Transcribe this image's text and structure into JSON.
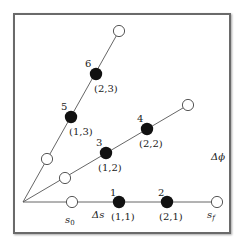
{
  "diagram": {
    "type": "ray-lattice",
    "colors": {
      "line": "#555555",
      "filled_node": "#111111",
      "open_node_fill": "#ffffff",
      "open_node_stroke": "#444444",
      "text": "#222222",
      "frame": "#6a6a6a"
    },
    "rays": [
      {
        "id": "ray-1",
        "nodes": [
          {
            "kind": "open",
            "label": "",
            "pair": ""
          },
          {
            "kind": "filled",
            "label": "1",
            "pair": "(1,1)"
          },
          {
            "kind": "filled",
            "label": "2",
            "pair": "(2,1)"
          },
          {
            "kind": "open",
            "label": "",
            "pair": ""
          }
        ]
      },
      {
        "id": "ray-2",
        "nodes": [
          {
            "kind": "open",
            "label": "",
            "pair": ""
          },
          {
            "kind": "filled",
            "label": "3",
            "pair": "(1,2)"
          },
          {
            "kind": "filled",
            "label": "4",
            "pair": "(2,2)"
          },
          {
            "kind": "open",
            "label": "",
            "pair": ""
          }
        ]
      },
      {
        "id": "ray-3",
        "nodes": [
          {
            "kind": "open",
            "label": "",
            "pair": ""
          },
          {
            "kind": "filled",
            "label": "5",
            "pair": "(1,3)"
          },
          {
            "kind": "filled",
            "label": "6",
            "pair": "(2,3)"
          },
          {
            "kind": "open",
            "label": "",
            "pair": ""
          }
        ]
      }
    ],
    "annotations": {
      "s0": "s",
      "s0_sub": "0",
      "sf": "s",
      "sf_sub": "f",
      "delta_s": "Δs",
      "delta_phi": "Δϕ"
    }
  }
}
